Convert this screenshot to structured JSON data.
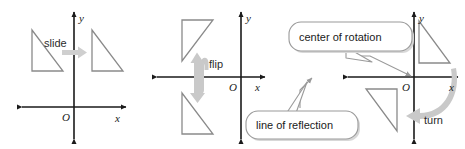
{
  "figure": {
    "width": 465,
    "height": 149,
    "background_color": "#ffffff",
    "axis_color": "#1a1a1a",
    "shape_color": "#8a8a8a",
    "arrow_color": "#cfcfcf",
    "callout_border_color": "#9a9a9a"
  },
  "panels": [
    {
      "id": "translation",
      "motion_label": "slide",
      "arrow_icon": "straight-right-arrow",
      "axes": {
        "x_label": "x",
        "y_label": "y",
        "origin_label": "O"
      },
      "shapes": [
        {
          "name": "preimage-triangle",
          "position": "upper-left-quadrant"
        },
        {
          "name": "image-triangle",
          "position": "upper-right-quadrant"
        }
      ]
    },
    {
      "id": "reflection",
      "motion_label": "flip",
      "arrow_icon": "u-turn-up-arrow",
      "axes": {
        "x_label": "x",
        "y_label": "y",
        "origin_label": "O"
      },
      "shapes": [
        {
          "name": "preimage-triangle",
          "position": "upper-left-quadrant"
        },
        {
          "name": "image-triangle",
          "position": "lower-left-quadrant"
        }
      ],
      "callout": {
        "label": "line of reflection",
        "points_to": "x-axis"
      }
    },
    {
      "id": "rotation",
      "motion_label": "turn",
      "arrow_icon": "curved-rotation-arrow",
      "axes": {
        "x_label": "x",
        "y_label": "y",
        "origin_label": "O"
      },
      "shapes": [
        {
          "name": "preimage-triangle",
          "position": "upper-right-quadrant"
        },
        {
          "name": "image-triangle",
          "position": "lower-left-quadrant"
        }
      ],
      "callout": {
        "label": "center of rotation",
        "points_to": "origin"
      }
    }
  ]
}
